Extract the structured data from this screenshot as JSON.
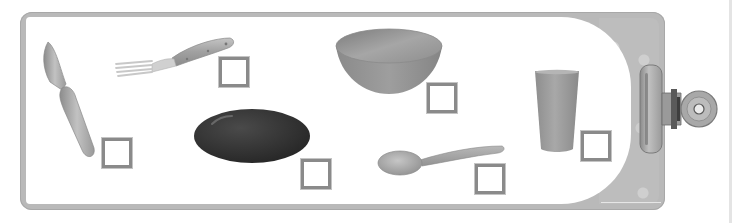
{
  "worksheet": {
    "type": "tableware picture checklist",
    "colors": {
      "frame": "#b9b9b9",
      "frame_border": "#a8a8a8",
      "paper": "#ffffff",
      "checkbox_border": "#8a8a8a",
      "plate": "#2e2e2e",
      "utensil": "#a5a5a5",
      "bowl": "#8f8f8f",
      "cup": "#9a9a9a"
    },
    "items": [
      {
        "name": "knife",
        "checked": false
      },
      {
        "name": "fork",
        "checked": false
      },
      {
        "name": "plate",
        "checked": false
      },
      {
        "name": "bowl",
        "checked": false
      },
      {
        "name": "spoon",
        "checked": false
      },
      {
        "name": "cup",
        "checked": false
      }
    ],
    "accessories": {
      "clip": "binder-clip"
    }
  }
}
